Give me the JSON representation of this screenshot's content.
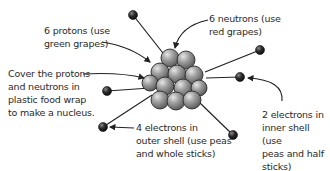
{
  "diagram": {
    "labels": {
      "protons": "6 protons (use\ngreen grapes)",
      "neutrons": "6 neutrons (use\nred grapes)",
      "nucleus": "Cover the protons\nand neutrons in\nplastic food wrap\nto make a nucleus.",
      "outer_shell": "4 electrons in\nouter shell (use peas\nand whole sticks)",
      "inner_shell": "2 electrons in\ninner shell (use\npeas and half\nsticks)"
    },
    "colors": {
      "nucleus_ball": "#8c8c8c",
      "electron": "#2b2b2b",
      "line": "#222222",
      "text": "#2a2a2a"
    },
    "counts": {
      "protons": 6,
      "neutrons": 6,
      "inner_electrons": 2,
      "outer_electrons": 4
    }
  }
}
